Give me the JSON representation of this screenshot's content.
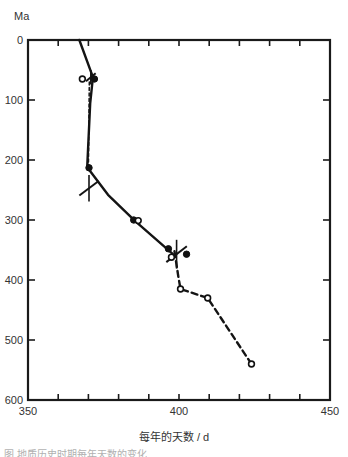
{
  "figure": {
    "y_unit_label": "Ma",
    "x_axis_label": "每年的天数 / d",
    "caption_partial": "图         地质历史时期每年天数的变化"
  },
  "chart_data": {
    "type": "line",
    "title": "",
    "xlabel": "每年的天数 / d",
    "ylabel": "Ma",
    "xlim": [
      350,
      450
    ],
    "ylim": [
      600,
      0
    ],
    "y_inverted": true,
    "grid": false,
    "legend": "none",
    "xticks": [
      350,
      360,
      370,
      380,
      390,
      400,
      410,
      420,
      430,
      440,
      450
    ],
    "xtick_labels": [
      "350",
      "",
      "",
      "",
      "",
      "400",
      "",
      "",
      "",
      "",
      "450"
    ],
    "yticks": [
      0,
      100,
      200,
      300,
      400,
      500,
      600
    ],
    "ytick_labels": [
      "0",
      "100",
      "200",
      "300",
      "400",
      "500",
      "600"
    ],
    "series": [
      {
        "name": "solid-trend-line",
        "style": "solid",
        "x": [
          367.0,
          371.5,
          370.6,
          369.6,
          376.5,
          385.5,
          398.0
        ],
        "y": [
          0,
          62,
          105,
          212,
          258,
          302,
          357
        ]
      },
      {
        "name": "dashed-trend-line",
        "style": "dashed",
        "x": [
          398.5,
          399.8,
          400.5,
          409.5,
          424.0
        ],
        "y": [
          352,
          395,
          415,
          430,
          540
        ]
      },
      {
        "name": "vertical-dashed-segment",
        "style": "dashed",
        "x": [
          370.3,
          370.0
        ],
        "y": [
          70,
          215
        ]
      }
    ],
    "points_filled": [
      {
        "x": 372.0,
        "y": 65
      },
      {
        "x": 370.2,
        "y": 213
      },
      {
        "x": 385.0,
        "y": 300
      },
      {
        "x": 396.5,
        "y": 348
      },
      {
        "x": 402.5,
        "y": 357
      }
    ],
    "points_open": [
      {
        "x": 368.0,
        "y": 65
      },
      {
        "x": 386.5,
        "y": 301
      },
      {
        "x": 397.5,
        "y": 362
      },
      {
        "x": 400.5,
        "y": 415
      },
      {
        "x": 409.5,
        "y": 430
      },
      {
        "x": 424.0,
        "y": 540
      }
    ],
    "error_crosses": [
      {
        "x": 370.8,
        "y": 62,
        "dx": 1.6,
        "dy": 12
      },
      {
        "x": 370.2,
        "y": 247,
        "dx": 3.2,
        "dy": 22
      },
      {
        "x": 399.2,
        "y": 357,
        "dx": 3.4,
        "dy": 24
      }
    ],
    "annotations": []
  }
}
